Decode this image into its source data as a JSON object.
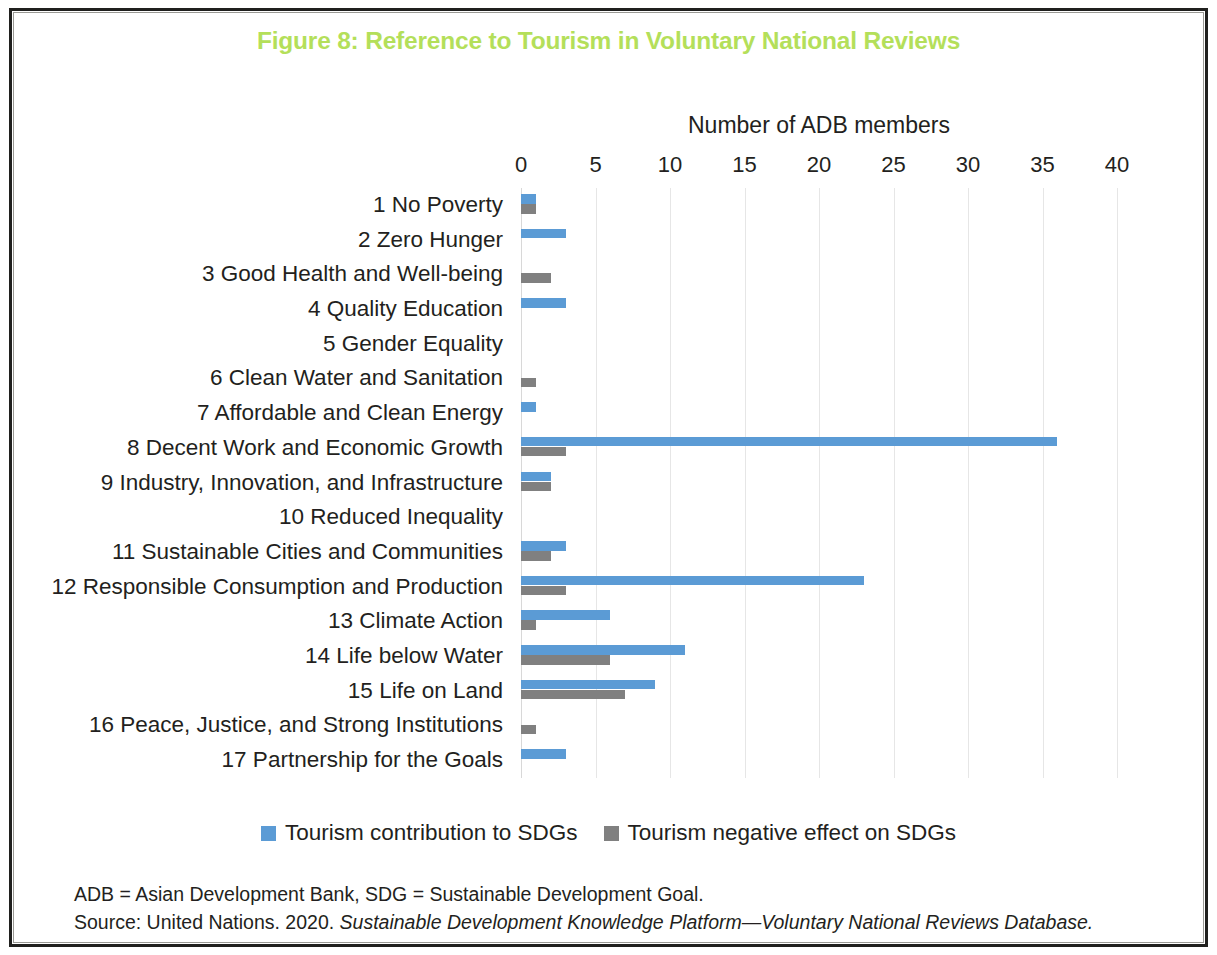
{
  "figure": {
    "title": "Figure 8: Reference to Tourism in Voluntary National Reviews",
    "title_color": "#b4df5a"
  },
  "axis": {
    "title": "Number of ADB members",
    "ticks": [
      0,
      5,
      10,
      15,
      20,
      25,
      30,
      35,
      40
    ],
    "min": 0,
    "max": 40
  },
  "legend": {
    "items": [
      {
        "label": "Tourism contribution to SDGs",
        "color": "#5b9bd5",
        "key": "contribution"
      },
      {
        "label": "Tourism negative effect on SDGs",
        "color": "#808080",
        "key": "negative"
      }
    ]
  },
  "notes": {
    "abbreviations": "ADB = Asian Development Bank, SDG = Sustainable Development Goal.",
    "source_prefix": "Source: United Nations. 2020. ",
    "source_italic": "Sustainable Development Knowledge Platform—Voluntary National Reviews Database."
  },
  "chart_data": {
    "type": "bar",
    "orientation": "horizontal",
    "title": "Figure 8: Reference to Tourism in Voluntary National Reviews",
    "xlabel": "Number of ADB members",
    "ylabel": "",
    "xlim": [
      0,
      40
    ],
    "xticks": [
      0,
      5,
      10,
      15,
      20,
      25,
      30,
      35,
      40
    ],
    "grid": "vertical",
    "legend_position": "bottom",
    "categories": [
      "1 No Poverty",
      "2 Zero Hunger",
      "3 Good Health and Well-being",
      "4 Quality Education",
      "5 Gender Equality",
      "6 Clean Water and Sanitation",
      "7 Affordable and Clean Energy",
      "8 Decent Work and Economic Growth",
      "9 Industry, Innovation, and Infrastructure",
      "10 Reduced Inequality",
      "11 Sustainable Cities and Communities",
      "12 Responsible Consumption and Production",
      "13 Climate Action",
      "14 Life below Water",
      "15 Life on Land",
      "16 Peace, Justice, and Strong Institutions",
      "17 Partnership for the Goals"
    ],
    "series": [
      {
        "name": "Tourism contribution to SDGs",
        "color": "#5b9bd5",
        "values": [
          1,
          3,
          0,
          3,
          0,
          0,
          1,
          36,
          2,
          0,
          3,
          23,
          6,
          11,
          9,
          0,
          3
        ]
      },
      {
        "name": "Tourism negative effect on SDGs",
        "color": "#808080",
        "values": [
          1,
          0,
          2,
          0,
          0,
          1,
          0,
          3,
          2,
          0,
          2,
          3,
          1,
          6,
          7,
          1,
          0
        ]
      }
    ]
  }
}
